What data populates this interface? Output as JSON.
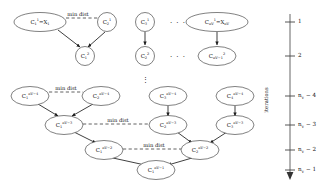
{
  "figure": {
    "kind": "hierarchical-clustering-dendrogram",
    "axis_title": "iterations"
  },
  "nodes": [
    {
      "id": "n1",
      "base": "C",
      "sub": "1",
      "sup": "1",
      "extra": " = X",
      "extra_sub": "1",
      "cx": 40,
      "cy": 22,
      "rx": 26,
      "ry": 9.5,
      "shape": "ellipse",
      "label": "C₁¹ = X₁"
    },
    {
      "id": "n2",
      "base": "C",
      "sub": "2",
      "sup": "1",
      "extra": "",
      "extra_sub": "",
      "cx": 107,
      "cy": 22,
      "rx": 9.5,
      "ry": 9.5,
      "shape": "circle",
      "label": "C₂¹"
    },
    {
      "id": "n3",
      "base": "C",
      "sub": "3",
      "sup": "1",
      "extra": "",
      "extra_sub": "",
      "cx": 145,
      "cy": 22,
      "rx": 9.5,
      "ry": 9.5,
      "shape": "circle",
      "label": "C₃¹"
    },
    {
      "id": "n4",
      "base": "C",
      "sub": "nV",
      "sup": "1",
      "extra": " = X",
      "extra_sub": "nV",
      "cx": 217,
      "cy": 22,
      "rx": 31,
      "ry": 9.5,
      "shape": "ellipse",
      "label": "Cⁿᵛ¹ = Xⁿᵛ"
    },
    {
      "id": "n5",
      "base": "C",
      "sub": "1",
      "sup": "2",
      "extra": "",
      "extra_sub": "",
      "cx": 85,
      "cy": 56,
      "rx": 9.5,
      "ry": 9.5,
      "shape": "circle",
      "label": "C₁²"
    },
    {
      "id": "n6",
      "base": "C",
      "sub": "2",
      "sup": "2",
      "extra": "",
      "extra_sub": "",
      "cx": 145,
      "cy": 56,
      "rx": 9.5,
      "ry": 9.5,
      "shape": "circle",
      "label": "C₂²"
    },
    {
      "id": "n7",
      "base": "C",
      "sub": "nV-1",
      "sup": "2",
      "extra": "",
      "extra_sub": "",
      "cx": 217,
      "cy": 56,
      "rx": 19,
      "ry": 9.5,
      "shape": "ellipse",
      "label": "C²ₙᵛ₋₁"
    },
    {
      "id": "n8",
      "base": "C",
      "sub": "1",
      "sup": "nV-4",
      "extra": "",
      "extra_sub": "",
      "cx": 30,
      "cy": 96,
      "rx": 19,
      "ry": 9.5,
      "shape": "ellipse",
      "label": "C₁^{nV-4}"
    },
    {
      "id": "n9",
      "base": "C",
      "sub": "2",
      "sup": "nV-4",
      "extra": "",
      "extra_sub": "",
      "cx": 101,
      "cy": 96,
      "rx": 19,
      "ry": 9.5,
      "shape": "ellipse",
      "label": "C₂^{nV-4}"
    },
    {
      "id": "n10",
      "base": "C",
      "sub": "3",
      "sup": "nV-4",
      "extra": "",
      "extra_sub": "",
      "cx": 168,
      "cy": 96,
      "rx": 19,
      "ry": 9.5,
      "shape": "ellipse",
      "label": "C₃^{nV-4}"
    },
    {
      "id": "n11",
      "base": "C",
      "sub": "4",
      "sup": "nV-4",
      "extra": "",
      "extra_sub": "",
      "cx": 235,
      "cy": 96,
      "rx": 19,
      "ry": 9.5,
      "shape": "ellipse",
      "label": "C₄^{nV-4}"
    },
    {
      "id": "n12",
      "base": "C",
      "sub": "1",
      "sup": "nV-3",
      "extra": "",
      "extra_sub": "",
      "cx": 64,
      "cy": 125,
      "rx": 19,
      "ry": 9.5,
      "shape": "ellipse",
      "label": "C₁^{nV-3}"
    },
    {
      "id": "n13",
      "base": "C",
      "sub": "2",
      "sup": "nV-3",
      "extra": "",
      "extra_sub": "",
      "cx": 168,
      "cy": 125,
      "rx": 19,
      "ry": 9.5,
      "shape": "ellipse",
      "label": "C₂^{nV-3}"
    },
    {
      "id": "n14",
      "base": "C",
      "sub": "3",
      "sup": "nV-3",
      "extra": "",
      "extra_sub": "",
      "cx": 235,
      "cy": 125,
      "rx": 19,
      "ry": 9.5,
      "shape": "ellipse",
      "label": "C₃^{nV-3}"
    },
    {
      "id": "n15",
      "base": "C",
      "sub": "1",
      "sup": "nV-2",
      "extra": "",
      "extra_sub": "",
      "cx": 104,
      "cy": 150,
      "rx": 19,
      "ry": 9.5,
      "shape": "ellipse",
      "label": "C₁^{nV-2}"
    },
    {
      "id": "n16",
      "base": "C",
      "sub": "2",
      "sup": "nV-2",
      "extra": "",
      "extra_sub": "",
      "cx": 200,
      "cy": 150,
      "rx": 19,
      "ry": 9.5,
      "shape": "ellipse",
      "label": "C₂^{nV-2}"
    },
    {
      "id": "n17",
      "base": "C",
      "sub": "1",
      "sup": "nV-1",
      "extra": "",
      "extra_sub": "",
      "cx": 156,
      "cy": 170,
      "rx": 19,
      "ry": 9.5,
      "shape": "ellipse",
      "label": "C₁^{nV-1}"
    }
  ],
  "min_dist_labels": [
    {
      "id": "md1",
      "text": "min dist",
      "x": 78,
      "y": 16
    },
    {
      "id": "md2",
      "text": "min dist",
      "x": 66,
      "y": 90
    },
    {
      "id": "md3",
      "text": "min dist",
      "x": 118,
      "y": 122
    },
    {
      "id": "md4",
      "text": "min dist",
      "x": 154,
      "y": 147
    }
  ],
  "ellipses_dots": [
    {
      "id": "dots-row1",
      "text": "· · ·",
      "x": 178,
      "y": 24
    },
    {
      "id": "dots-row2",
      "text": "· · ·",
      "x": 178,
      "y": 58
    },
    {
      "id": "dots-vertical",
      "text": "⋮",
      "x": 145,
      "y": 80
    }
  ],
  "axis": {
    "title": "iterations",
    "x": 290,
    "top": 14,
    "bottom": 178,
    "ticks": [
      {
        "id": "t1",
        "label": "1",
        "y": 22
      },
      {
        "id": "t2",
        "label": "2",
        "y": 56
      },
      {
        "id": "t3",
        "label": "nV − 4",
        "y": 96
      },
      {
        "id": "t4",
        "label": "nV − 3",
        "y": 125
      },
      {
        "id": "t5",
        "label": "nV − 2",
        "y": 150
      },
      {
        "id": "t6",
        "label": "nV − 1",
        "y": 170
      }
    ]
  }
}
